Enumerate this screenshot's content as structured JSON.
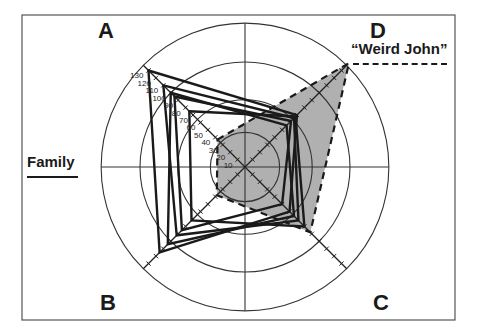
{
  "chart_data": {
    "type": "radar",
    "title": "",
    "axes": [
      "A",
      "D",
      "C",
      "B"
    ],
    "axis_directions": {
      "A": "upper-left",
      "D": "upper-right",
      "C": "lower-right",
      "B": "lower-left"
    },
    "scale_ticks": [
      10,
      20,
      30,
      40,
      50,
      60,
      70,
      80,
      90,
      100,
      110,
      120,
      130
    ],
    "tick_labels_shown_on_axis": "A",
    "range": [
      0,
      140
    ],
    "reference_circles": [
      33,
      64,
      100,
      137
    ],
    "series": [
      {
        "name": "Family",
        "style": "solid",
        "fill": "none",
        "values": {
          "A": 130,
          "D": 70,
          "C": 60,
          "B": 115
        }
      },
      {
        "name": "Family",
        "style": "solid",
        "fill": "none",
        "values": {
          "A": 110,
          "D": 66,
          "C": 72,
          "B": 92
        }
      },
      {
        "name": "Family",
        "style": "solid",
        "fill": "none",
        "values": {
          "A": 95,
          "D": 62,
          "C": 50,
          "B": 85
        }
      },
      {
        "name": "Family",
        "style": "solid",
        "fill": "none",
        "values": {
          "A": 75,
          "D": 68,
          "C": 80,
          "B": 72
        }
      },
      {
        "name": "Family",
        "style": "solid",
        "fill": "none",
        "values": {
          "A": 100,
          "D": 56,
          "C": 66,
          "B": 104
        }
      },
      {
        "name": "“Weird John”",
        "style": "dashed",
        "fill": "#b0b0b0",
        "values": {
          "A": 37,
          "D": 140,
          "C": 88,
          "B": 38
        }
      }
    ],
    "legend": [
      {
        "label": "Family",
        "line": "solid",
        "position": "left"
      },
      {
        "label": "“Weird John”",
        "line": "dashed",
        "position": "upper-right"
      }
    ],
    "grid": true
  },
  "labels": {
    "A": "A",
    "B": "B",
    "C": "C",
    "D": "D",
    "family": "Family",
    "weird_john": "“Weird John”"
  },
  "colors": {
    "frame": "#555555",
    "lines": "#1a1a1a",
    "grid": "#333333",
    "weird_fill": "#b0b0b0"
  }
}
